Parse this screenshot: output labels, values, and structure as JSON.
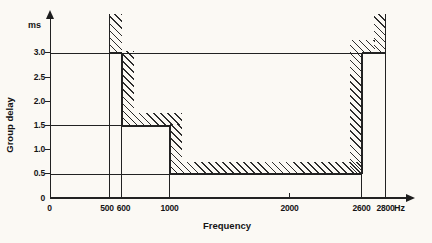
{
  "figure_labels": {
    "y_unit": "ms",
    "x_unit": "Hz",
    "x_title": "Frequency",
    "y_title": "Group delay"
  },
  "chart_data": {
    "type": "area",
    "xlabel": "Frequency",
    "x_unit": "Hz",
    "ylabel": "Group delay",
    "y_unit": "ms",
    "xlim": [
      0,
      3050
    ],
    "ylim": [
      0,
      3.8
    ],
    "grid": "off",
    "legend": "none",
    "x_ticks": [
      {
        "value": 0,
        "label": "0"
      },
      {
        "value": 500,
        "label": "500"
      },
      {
        "value": 600,
        "label": "600"
      },
      {
        "value": 1000,
        "label": "1000"
      },
      {
        "value": 2000,
        "label": "2000"
      },
      {
        "value": 2600,
        "label": "2600"
      },
      {
        "value": 2800,
        "label": "2800"
      }
    ],
    "y_ticks": [
      {
        "value": 3.0,
        "label": "3.0"
      },
      {
        "value": 2.5,
        "label": "2.5"
      },
      {
        "value": 2.0,
        "label": "2.0"
      },
      {
        "value": 1.5,
        "label": "1.5"
      },
      {
        "value": 1.0,
        "label": "1.0"
      },
      {
        "value": 0.5,
        "label": "0.5"
      },
      {
        "value": 0,
        "label": "0"
      }
    ],
    "mask_segments": [
      {
        "f_start_hz": 500,
        "f_end_hz": 600,
        "max_delay_ms": 3.0
      },
      {
        "f_start_hz": 600,
        "f_end_hz": 1000,
        "max_delay_ms": 1.5
      },
      {
        "f_start_hz": 1000,
        "f_end_hz": 2600,
        "max_delay_ms": 0.5
      },
      {
        "f_start_hz": 2600,
        "f_end_hz": 2800,
        "max_delay_ms": 3.0
      }
    ],
    "annotations": {
      "hatching": "diagonal hatching marks the forbidden region above/outside the delay limit mask"
    }
  }
}
